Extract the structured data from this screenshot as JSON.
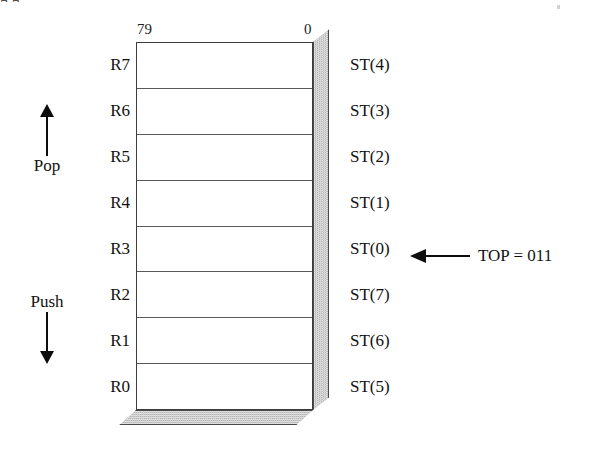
{
  "diagram": {
    "title_remnant": "g                                 g",
    "bit_labels": {
      "msb": "79",
      "lsb": "0"
    },
    "registers": [
      {
        "name": "R7",
        "alias": "ST(4)"
      },
      {
        "name": "R6",
        "alias": "ST(3)"
      },
      {
        "name": "R5",
        "alias": "ST(2)"
      },
      {
        "name": "R4",
        "alias": "ST(1)"
      },
      {
        "name": "R3",
        "alias": "ST(0)"
      },
      {
        "name": "R2",
        "alias": "ST(7)"
      },
      {
        "name": "R1",
        "alias": "ST(6)"
      },
      {
        "name": "R0",
        "alias": "ST(5)"
      }
    ],
    "directions": {
      "pop": "Pop",
      "push": "Push"
    },
    "top_pointer": {
      "label": "TOP = 011",
      "points_to": "ST(0)"
    },
    "colors": {
      "ink": "#111111",
      "outline": "#3d3d3d",
      "shade_face": "#b4b4b4",
      "cell_fill": "#ffffff",
      "background": "#ffffff"
    }
  }
}
